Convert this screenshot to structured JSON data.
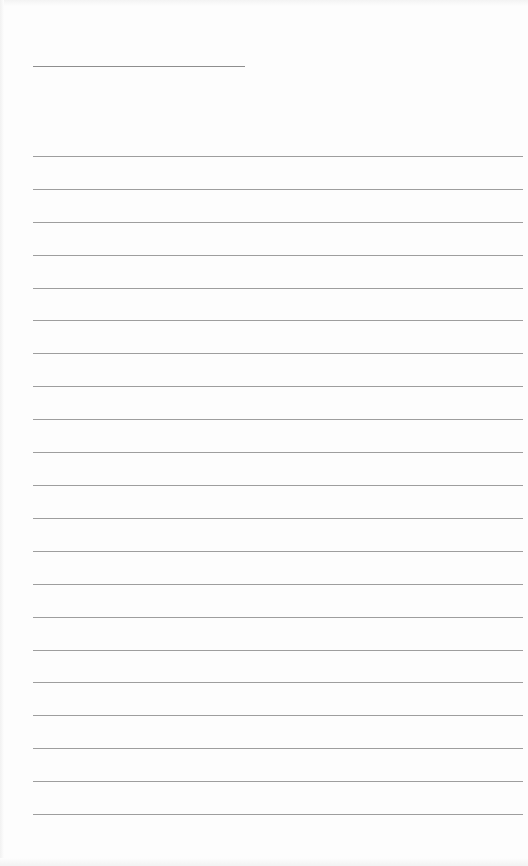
{
  "document": {
    "type": "lined-paper",
    "background_color": "#fdfdfd",
    "line_color": "#9e9e9e",
    "header_line_color": "#8e8e8e",
    "header_line": {
      "x1": 33,
      "x2": 245,
      "y": 66
    },
    "ruled_lines": {
      "count": 21,
      "x1": 33,
      "x2": 523,
      "y_positions": [
        156,
        189,
        222,
        255,
        288,
        320,
        353,
        386,
        419,
        452,
        485,
        518,
        551,
        584,
        617,
        650,
        682,
        715,
        748,
        781,
        814
      ]
    }
  }
}
